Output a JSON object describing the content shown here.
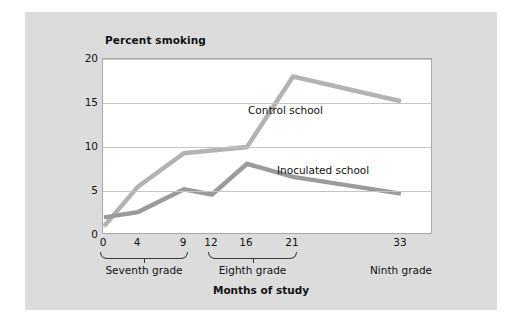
{
  "chart_data": {
    "type": "line",
    "title": "Percent smoking",
    "xlabel": "Months of study",
    "ylabel": "Percent smoking",
    "x": [
      0,
      4,
      9,
      12,
      16,
      21,
      33
    ],
    "xtick_labels": [
      "0",
      "4",
      "9",
      "12",
      "16",
      "21",
      "33"
    ],
    "ytick_labels": [
      "0",
      "5",
      "10",
      "15",
      "20"
    ],
    "yticks": [
      0,
      5,
      10,
      15,
      20
    ],
    "ylim": [
      0,
      20
    ],
    "grid": "horizontal",
    "legend_position": "inline-annotations",
    "series": [
      {
        "name": "Control school",
        "color": "#b3b3b3",
        "values": [
          1.0,
          5.5,
          9.3,
          9.6,
          10.0,
          18.0,
          15.2
        ]
      },
      {
        "name": "Inoculated school",
        "color": "#9b9b9b",
        "values": [
          2.0,
          2.6,
          5.2,
          4.6,
          8.1,
          6.6,
          4.7
        ]
      }
    ],
    "annotations": [
      {
        "text": "Control school",
        "near_x": 21,
        "near_y": 15
      },
      {
        "text": "Inoculated school",
        "near_x": 26,
        "near_y": 8.5
      }
    ],
    "grade_groups": [
      {
        "label": "Seventh grade",
        "months": [
          0,
          4,
          9
        ]
      },
      {
        "label": "Eighth grade",
        "months": [
          12,
          16,
          21
        ]
      },
      {
        "label": "Ninth grade",
        "months": [
          33
        ]
      }
    ]
  },
  "figure": {
    "background_color": "#dcdcdc",
    "plot_background_color": "#ffffff",
    "gridline_color": "#c4c4c4",
    "axis_color": "#a9a9a9",
    "text_color": "#111111"
  }
}
